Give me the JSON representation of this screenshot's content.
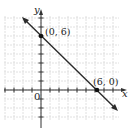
{
  "chart_data": {
    "type": "line",
    "title": "",
    "xlabel": "x",
    "ylabel": "y",
    "origin_label": "0",
    "xlim": [
      -4,
      9
    ],
    "ylim": [
      -4,
      8
    ],
    "grid": true,
    "series": [
      {
        "name": "line through (0,6) and (6,0)",
        "x": [
          -2,
          8
        ],
        "y": [
          8,
          -2
        ]
      }
    ],
    "points": [
      {
        "x": 0,
        "y": 6,
        "label": "(0, 6)"
      },
      {
        "x": 6,
        "y": 0,
        "label": "(6, 0)"
      }
    ]
  },
  "labels": {
    "x_axis": "x",
    "y_axis": "y",
    "origin": "0",
    "point_a": "(0, 6)",
    "point_b": "(6, 0)"
  },
  "colors": {
    "grid": "#d8d8d8",
    "axis": "#333333",
    "line": "#2a2a2a",
    "point": "#111111"
  }
}
